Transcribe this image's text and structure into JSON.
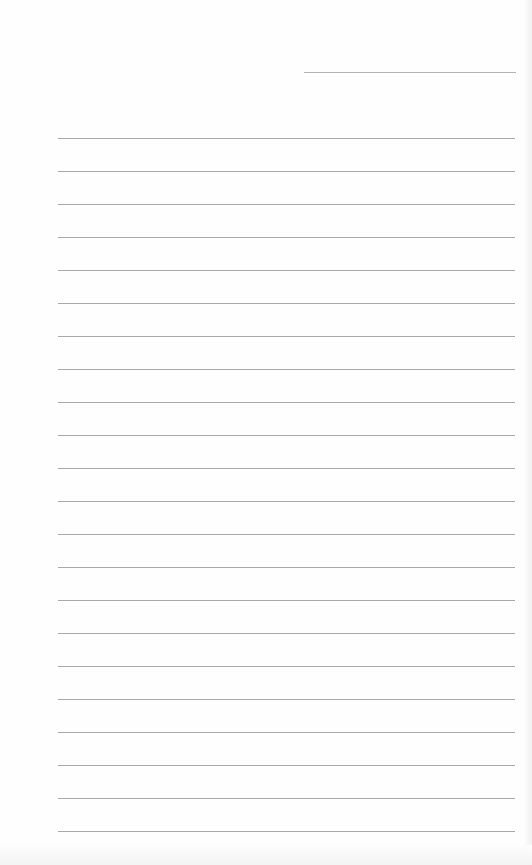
{
  "page": {
    "type": "lined-paper",
    "header_line": {
      "x": 304,
      "y": 72,
      "width": 212
    },
    "rules": {
      "count": 22,
      "start_y": 138,
      "spacing": 33,
      "x": 58,
      "width": 457,
      "color": "#a9a9a9"
    },
    "background_color": "#fefefe"
  }
}
